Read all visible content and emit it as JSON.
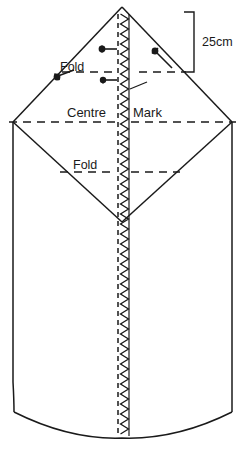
{
  "diagram": {
    "labels": {
      "fold_top": "Fold",
      "fold_bottom": "Fold",
      "centre": "Centre",
      "mark": "Mark",
      "dimension": "25cm"
    },
    "annotations": [
      {
        "name": "fold-line-upper",
        "text": "Fold"
      },
      {
        "name": "centre-mark-line",
        "text": "Centre Mark"
      },
      {
        "name": "fold-line-lower",
        "text": "Fold"
      },
      {
        "name": "dimension-25cm",
        "text": "25cm"
      }
    ],
    "colors": {
      "ink": "#1a1a1a",
      "paper": "#ffffff"
    },
    "shape": {
      "apex_x": 122,
      "apex_y": 7,
      "left_corner_x": 13,
      "left_corner_y": 122,
      "right_corner_x": 232,
      "right_corner_y": 122,
      "v_point_x": 122,
      "v_point_y": 222,
      "hem_center_y": 438
    }
  }
}
